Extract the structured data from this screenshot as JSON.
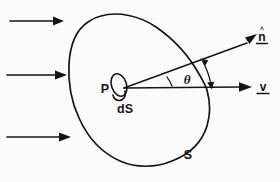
{
  "figure": {
    "background_color": "#fbfbfb",
    "ink_color": "#141414",
    "width": 280,
    "height": 182
  },
  "labels": {
    "normal_vector": "n",
    "normal_hat": "^",
    "velocity_vector": "v",
    "angle": "θ",
    "point": "P",
    "surface_element": "dS",
    "surface": "S"
  },
  "flow_arrows": [
    {
      "name": "flow-arrow-top",
      "x1": 10,
      "y1": 21,
      "x2": 60,
      "y2": 21
    },
    {
      "name": "flow-arrow-middle",
      "x1": 7,
      "y1": 75,
      "x2": 63,
      "y2": 75
    },
    {
      "name": "flow-arrow-bottom",
      "x1": 7,
      "y1": 137,
      "x2": 68,
      "y2": 137
    }
  ],
  "vectors": [
    {
      "name": "normal-vector-arrow",
      "label": "n",
      "x1": 124,
      "y1": 89,
      "x2": 258,
      "y2": 40
    },
    {
      "name": "velocity-vector-arrow",
      "label": "v",
      "x1": 124,
      "y1": 89,
      "x2": 254,
      "y2": 87
    }
  ],
  "angle_marker": {
    "name": "theta-angle-arc",
    "symbol": "θ",
    "between": [
      "v",
      "n"
    ]
  },
  "geometry": {
    "surface_outline_name": "closed-surface-outline",
    "surface_element_name": "surface-element-ellipse",
    "point_name": "point-P"
  }
}
